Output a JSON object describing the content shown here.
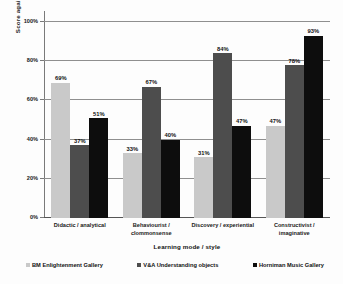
{
  "chart_data": {
    "type": "bar",
    "title": "",
    "xlabel": "Learning mode / style",
    "ylabel": "Score against criteria",
    "ylim": [
      0,
      100
    ],
    "yticks": [
      "0%",
      "20%",
      "40%",
      "60%",
      "80%",
      "100%"
    ],
    "ytick_values": [
      0,
      20,
      40,
      60,
      80,
      100
    ],
    "grid": true,
    "legend_position": "bottom",
    "value_suffix": "%",
    "categories": [
      "Didactic / analytical",
      "Behaviourist / clommonsense",
      "Discovery / experiential",
      "Constructivist / imaginative"
    ],
    "series": [
      {
        "name": "BM Enlightenment Gallery",
        "color": "#c9c9c9",
        "values": [
          69,
          33,
          31,
          47
        ],
        "labels": [
          "69%",
          "33%",
          "31%",
          "47%"
        ]
      },
      {
        "name": "V&A Understanding objects",
        "color": "#4d4d4d",
        "values": [
          37,
          67,
          84,
          78
        ],
        "labels": [
          "37%",
          "67%",
          "84%",
          "78%"
        ]
      },
      {
        "name": "Horniman Music Gallery",
        "color": "#0d0d0d",
        "values": [
          51,
          40,
          47,
          93
        ],
        "labels": [
          "51%",
          "40%",
          "47%",
          "93%"
        ]
      }
    ]
  }
}
